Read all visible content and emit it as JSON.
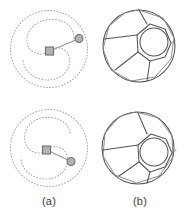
{
  "figure": {
    "background_color": "#ffffff",
    "width": 189,
    "height": 218,
    "columns": [
      {
        "key": "a",
        "caption": "(a)"
      },
      {
        "key": "b",
        "caption": "(b)"
      }
    ],
    "captions": {
      "a": "(a)",
      "b": "(b)"
    }
  },
  "colors": {
    "spiral_stroke": "#a9a9ad",
    "arm_stroke": "#97979c",
    "marker_fill": "#b4b4b8",
    "marker_stroke": "#6e6e73",
    "cell_stroke": "#55555a",
    "cell_stroke_soft": "#86868c",
    "caption_text": "#3a3a3a"
  },
  "panels": {
    "a_top": {
      "name": "dotted-double-spiral-top",
      "type": "spiral-trajectory",
      "outer_radius": 39,
      "center": {
        "x": 45,
        "y": 45
      },
      "source_marker": {
        "shape": "square",
        "x": 42,
        "y": 47,
        "size": 8
      },
      "end_marker": {
        "shape": "circle",
        "x": 76,
        "y": 34,
        "radius": 4
      },
      "arm": {
        "x1": 42,
        "y1": 47,
        "x2": 76,
        "y2": 34
      },
      "arm_angle_deg": -21,
      "spiral_turns": 2.0,
      "style": "dotted"
    },
    "b_top": {
      "name": "cell-polygon-top",
      "type": "cell-diagram",
      "outer_radius": 37,
      "center": {
        "x": 45,
        "y": 42
      },
      "inner_polygon_sides": 7,
      "inner_polygon_radius": 17,
      "inner_polygon_center": {
        "x": 55,
        "y": 36
      },
      "inner_circle_radius": 14,
      "radial_divider_count": 3,
      "style": "solid"
    },
    "a_bot": {
      "name": "dotted-double-spiral-bottom",
      "type": "spiral-trajectory",
      "outer_radius": 39,
      "center": {
        "x": 45,
        "y": 45
      },
      "source_marker": {
        "shape": "square",
        "x": 40,
        "y": 47,
        "size": 8
      },
      "end_marker": {
        "shape": "circle",
        "x": 67,
        "y": 58,
        "radius": 4
      },
      "arm": {
        "x1": 40,
        "y1": 47,
        "x2": 67,
        "y2": 58
      },
      "arm_angle_deg": 22,
      "spiral_turns": 2.0,
      "style": "dotted"
    },
    "b_bot": {
      "name": "cell-polygon-bottom",
      "type": "cell-diagram",
      "outer_radius": 37,
      "center": {
        "x": 43,
        "y": 45
      },
      "inner_polygon_sides": 7,
      "inner_polygon_radius": 17,
      "inner_polygon_center": {
        "x": 55,
        "y": 52
      },
      "inner_circle_radius": 14,
      "radial_divider_count": 3,
      "style": "solid"
    }
  }
}
